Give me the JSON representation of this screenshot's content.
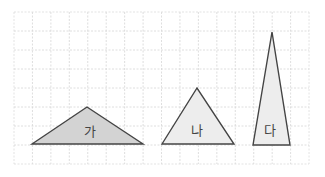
{
  "diagram": {
    "type": "grid-triangles",
    "grid": {
      "left": 14,
      "top": 12,
      "cols": 16,
      "rows": 8,
      "cell_w": 18.44,
      "cell_h": 19.0,
      "line_color": "#d6d6d6",
      "border_color": "#dcdcdc"
    },
    "stroke_color": "#444444",
    "shapes": [
      {
        "id": "ga",
        "label": "가",
        "points": [
          [
            32,
            144
          ],
          [
            87,
            107
          ],
          [
            143,
            144
          ]
        ],
        "fill": "#d3d3d3",
        "label_pos": [
          90,
          130
        ]
      },
      {
        "id": "na",
        "label": "나",
        "points": [
          [
            162,
            144
          ],
          [
            197,
            88
          ],
          [
            234,
            144
          ]
        ],
        "fill": "#ededed",
        "label_pos": [
          197,
          129
        ]
      },
      {
        "id": "da",
        "label": "다",
        "points": [
          [
            253,
            145
          ],
          [
            272,
            32
          ],
          [
            290,
            145
          ]
        ],
        "fill": "#ededed",
        "label_pos": [
          270,
          129
        ]
      }
    ]
  }
}
